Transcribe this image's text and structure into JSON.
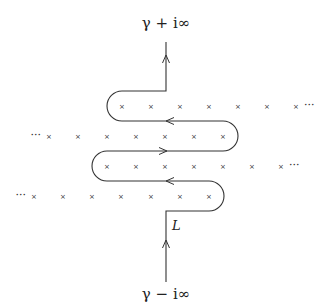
{
  "labels": {
    "top": "γ + i∞",
    "bottom": "γ − i∞",
    "contour": "L"
  },
  "rows": [
    {
      "y": 106,
      "xs": [
        122,
        151,
        180,
        209,
        238,
        267,
        296
      ],
      "ellipsis_right": "···",
      "ellipsis_left": null
    },
    {
      "y": 136,
      "xs": [
        49,
        78,
        107,
        136,
        165,
        194,
        223
      ],
      "ellipsis_left": "···",
      "ellipsis_right": null
    },
    {
      "y": 166,
      "xs": [
        107,
        136,
        165,
        194,
        223,
        252,
        281
      ],
      "ellipsis_right": "···",
      "ellipsis_left": null
    },
    {
      "y": 196,
      "xs": [
        34,
        63,
        92,
        121,
        151,
        180,
        209
      ],
      "ellipsis_left": "···",
      "ellipsis_right": null
    }
  ],
  "pole_marker": "×",
  "colors": {
    "line": "#333333",
    "text": "#222222"
  }
}
